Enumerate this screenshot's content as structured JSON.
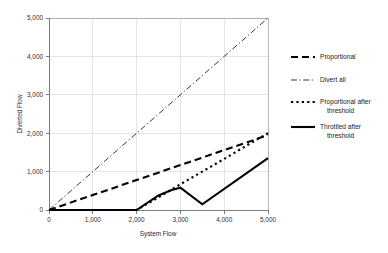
{
  "chart_data": {
    "type": "line",
    "title": "",
    "xlabel": "System Flow",
    "ylabel": "Diverted Flow",
    "xlim": [
      0,
      5000
    ],
    "ylim": [
      0,
      5000
    ],
    "grid": true,
    "legend_position": "right",
    "xticks": [
      0,
      1000,
      2000,
      3000,
      4000,
      5000
    ],
    "yticks": [
      0,
      1000,
      2000,
      3000,
      4000,
      5000
    ],
    "xtick_labels": [
      "0",
      "1,000",
      "2,000",
      "3,000",
      "4,000",
      "5,000"
    ],
    "ytick_labels": [
      "0",
      "1,000",
      "2,000",
      "3,000",
      "4,000",
      "5,000"
    ],
    "series": [
      {
        "name": "Proportional",
        "style": "long-dash",
        "dasharray": "7,4",
        "width": 2.1,
        "color": "#000000",
        "x": [
          0,
          1000,
          2000,
          3000,
          4000,
          5000
        ],
        "y": [
          0,
          390,
          780,
          1170,
          1560,
          1950
        ]
      },
      {
        "name": "Divert all",
        "style": "dash-dot",
        "dasharray": "6,2.5,1.2,2.5",
        "width": 0.8,
        "color": "#000000",
        "x": [
          0,
          1000,
          2000,
          3000,
          4000,
          5000
        ],
        "y": [
          0,
          1000,
          2000,
          3000,
          4000,
          5000
        ]
      },
      {
        "name": "Proportional after threshold",
        "style": "square-dot",
        "dasharray": "2.2,3.2",
        "width": 2.1,
        "color": "#000000",
        "x": [
          0,
          1000,
          2000,
          2500,
          3000,
          3500,
          4000,
          4500,
          5000
        ],
        "y": [
          0,
          0,
          0,
          330,
          670,
          1000,
          1330,
          1670,
          2000
        ]
      },
      {
        "name": "Throttled after threshold",
        "style": "solid",
        "dasharray": "none",
        "width": 2.1,
        "color": "#000000",
        "x": [
          0,
          1000,
          2000,
          2500,
          2800,
          3000,
          3500,
          5000
        ],
        "y": [
          0,
          0,
          0,
          380,
          520,
          580,
          150,
          1350
        ]
      }
    ]
  },
  "axes": {
    "x_title": "System Flow",
    "y_title": "Diverted Flow"
  },
  "legend": {
    "entries": [
      {
        "label": "Proportional",
        "label_line2": ""
      },
      {
        "label": "Divert all",
        "label_line2": ""
      },
      {
        "label": "Proportional after",
        "label_line2": "threshold"
      },
      {
        "label": "Throttled after",
        "label_line2": "threshold"
      }
    ]
  }
}
